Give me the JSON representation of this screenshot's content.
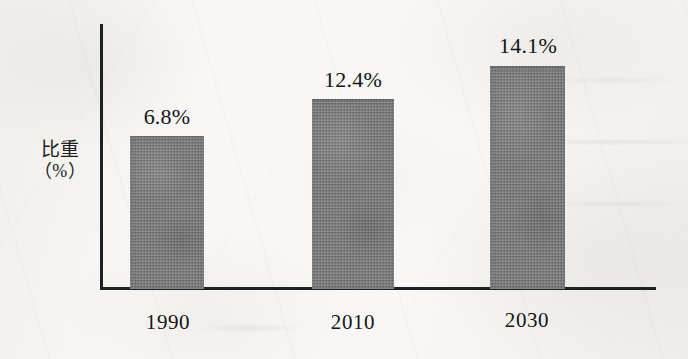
{
  "chart_data": {
    "type": "bar",
    "title": "",
    "subtitle": "",
    "xlabel": "",
    "ylabel": "比重\n（%）",
    "ylabel_lines": [
      "比重",
      "（%）"
    ],
    "categories": [
      "1990",
      "2010",
      "2030"
    ],
    "values": [
      6.8,
      12.4,
      14.1
    ],
    "value_labels": [
      "6.8%",
      "12.4%",
      "14.1%"
    ],
    "series": [
      {
        "name": "比重",
        "values": [
          6.8,
          12.4,
          14.1
        ]
      }
    ],
    "unit": "%",
    "ylim": [
      0,
      17.3
    ],
    "grid": false,
    "legend": false,
    "legend_position": "none",
    "bar_color": "#7b7b7b",
    "axis_color": "#202020",
    "text_color": "#151515",
    "background_color": "#f8f7f5"
  },
  "axes": {
    "y_axis_name": "y-axis-line",
    "x_axis_name": "x-axis-line"
  },
  "bars": [
    {
      "category": "1990",
      "value": 6.8,
      "value_label": "6.8%",
      "left": 130,
      "top": 136,
      "width": 74,
      "height": 152,
      "label_left": 130,
      "label_top": 104,
      "label_width": 74,
      "category_left": 128,
      "category_top": 310,
      "category_width": 80
    },
    {
      "category": "2010",
      "value": 12.4,
      "value_label": "12.4%",
      "left": 312,
      "top": 99,
      "width": 82,
      "height": 189,
      "label_left": 308,
      "label_top": 67,
      "label_width": 90,
      "category_left": 313,
      "category_top": 310,
      "category_width": 80
    },
    {
      "category": "2030",
      "value": 14.1,
      "value_label": "14.1%",
      "left": 490,
      "top": 66,
      "width": 75,
      "height": 222,
      "label_left": 483,
      "label_top": 33,
      "label_width": 90,
      "category_left": 487,
      "category_top": 308,
      "category_width": 80
    }
  ]
}
